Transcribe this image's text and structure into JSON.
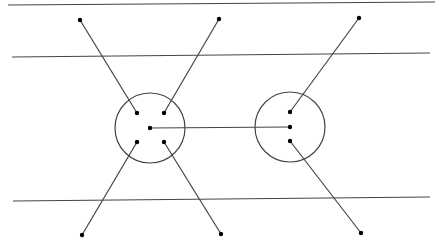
{
  "canvas": {
    "width": 443,
    "height": 251,
    "background": "#ffffff"
  },
  "colors": {
    "stroke": "#444444",
    "dot": "#000000"
  },
  "horizontal_lines": [
    {
      "x1": 8,
      "y1": 5,
      "x2": 435,
      "y2": 2
    },
    {
      "x1": 12,
      "y1": 57,
      "x2": 430,
      "y2": 53
    },
    {
      "x1": 13,
      "y1": 201,
      "x2": 430,
      "y2": 197
    }
  ],
  "circles": [
    {
      "cx": 150,
      "cy": 128,
      "r": 35
    },
    {
      "cx": 290,
      "cy": 127,
      "r": 35
    }
  ],
  "connectors": [
    {
      "x1": 80,
      "y1": 20,
      "x2": 137,
      "y2": 113
    },
    {
      "x1": 219,
      "y1": 19,
      "x2": 164,
      "y2": 113
    },
    {
      "x1": 82,
      "y1": 235,
      "x2": 137,
      "y2": 142
    },
    {
      "x1": 221,
      "y1": 234,
      "x2": 164,
      "y2": 142
    },
    {
      "x1": 150,
      "y1": 128,
      "x2": 290,
      "y2": 127
    },
    {
      "x1": 359,
      "y1": 18,
      "x2": 290,
      "y2": 112
    },
    {
      "x1": 361,
      "y1": 233,
      "x2": 290,
      "y2": 141
    }
  ],
  "dots": [
    {
      "x": 80,
      "y": 20
    },
    {
      "x": 219,
      "y": 19
    },
    {
      "x": 359,
      "y": 18
    },
    {
      "x": 82,
      "y": 235
    },
    {
      "x": 221,
      "y": 234
    },
    {
      "x": 361,
      "y": 233
    },
    {
      "x": 137,
      "y": 113
    },
    {
      "x": 164,
      "y": 113
    },
    {
      "x": 150,
      "y": 128
    },
    {
      "x": 137,
      "y": 142
    },
    {
      "x": 164,
      "y": 142
    },
    {
      "x": 290,
      "y": 112
    },
    {
      "x": 290,
      "y": 127
    },
    {
      "x": 290,
      "y": 141
    }
  ]
}
